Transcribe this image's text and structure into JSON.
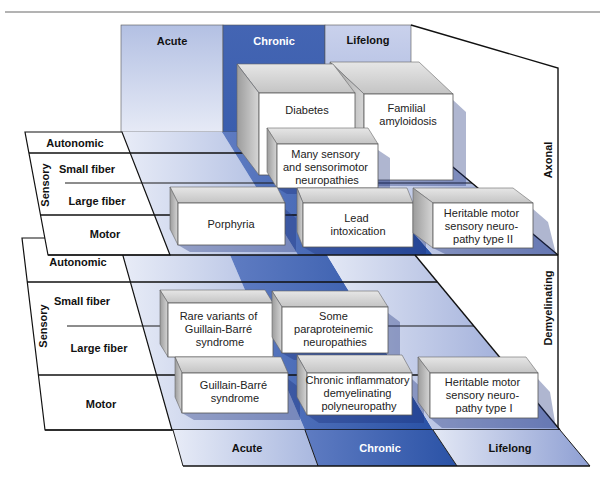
{
  "time_courses": {
    "back": [
      "Acute",
      "Chronic",
      "Lifelong"
    ],
    "front": [
      "Acute",
      "Chronic",
      "Lifelong"
    ]
  },
  "levels": {
    "axonal": "Axonal",
    "demyelinating": "Demyelinating"
  },
  "axonal_rows": {
    "autonomic": "Autonomic",
    "sensory": "Sensory",
    "small_fiber": "Small fiber",
    "large_fiber": "Large fiber",
    "motor": "Motor"
  },
  "demyelinating_rows": {
    "autonomic": "Autonomic",
    "sensory": "Sensory",
    "small_fiber": "Small fiber",
    "large_fiber": "Large fiber",
    "motor": "Motor"
  },
  "axonal_boxes": [
    {
      "lines": [
        "Familial",
        "amyloidosis"
      ],
      "time": "Lifelong",
      "fibers": "Sensory / Autonomic"
    },
    {
      "lines": [
        "Diabetes"
      ],
      "time": "Chronic",
      "fibers": "Sensory / Autonomic"
    },
    {
      "lines": [
        "Many sensory",
        "and sensorimotor",
        "neuropathies"
      ],
      "time": "Chronic",
      "fibers": "Sensory"
    },
    {
      "lines": [
        "Porphyria"
      ],
      "time": "Acute",
      "fibers": "Motor"
    },
    {
      "lines": [
        "Lead",
        "intoxication"
      ],
      "time": "Chronic",
      "fibers": "Motor"
    },
    {
      "lines": [
        "Heritable motor",
        "sensory neuro-",
        "pathy type II"
      ],
      "time": "Lifelong",
      "fibers": "Motor"
    }
  ],
  "demyelinating_boxes": [
    {
      "lines": [
        "Rare variants of",
        "Guillain-Barré",
        "syndrome"
      ],
      "time": "Acute",
      "fibers": "Sensory"
    },
    {
      "lines": [
        "Some",
        "paraproteinemic",
        "neuropathies"
      ],
      "time": "Chronic",
      "fibers": "Sensory"
    },
    {
      "lines": [
        "Guillain-Barré",
        "syndrome"
      ],
      "time": "Acute",
      "fibers": "Motor"
    },
    {
      "lines": [
        "Chronic inflammatory",
        "demyelinating",
        "polyneuropathy"
      ],
      "time": "Chronic",
      "fibers": "Motor"
    },
    {
      "lines": [
        "Heritable motor",
        "sensory neuro-",
        "pathy type I"
      ],
      "time": "Lifelong",
      "fibers": "Motor"
    }
  ],
  "colors": {
    "acute": "#c3cdea",
    "chronic": "#3c5fae",
    "lifelong": "#b6c2e4",
    "box_face": "#ffffff",
    "box_side": "#bdbdbd"
  }
}
